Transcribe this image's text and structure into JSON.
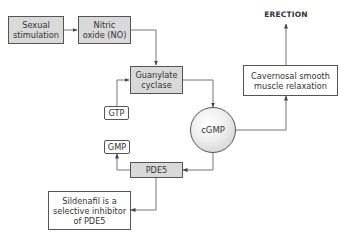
{
  "diagram": {
    "nodes": {
      "sexual_stimulation": "Sexual stimulation",
      "nitric_oxide": "Nitric oxide (NO)",
      "guanylate_cyclase": "Guanylate cyclase",
      "gtp": "GTP",
      "cgmp": "cGMP",
      "gmp": "GMP",
      "pde5": "PDE5",
      "sildenafil": "Sildenafil is a selective inhibitor of PDE5",
      "cavernosal": "Cavernosal smooth muscle relaxation",
      "erection": "ERECTION"
    },
    "edges": [
      {
        "from": "Sexual stimulation",
        "to": "Nitric oxide (NO)"
      },
      {
        "from": "Nitric oxide (NO)",
        "to": "Guanylate cyclase"
      },
      {
        "from": "GTP",
        "to": "Guanylate cyclase"
      },
      {
        "from": "Guanylate cyclase",
        "to": "cGMP"
      },
      {
        "from": "cGMP",
        "to": "Cavernosal smooth muscle relaxation"
      },
      {
        "from": "Cavernosal smooth muscle relaxation",
        "to": "ERECTION"
      },
      {
        "from": "cGMP",
        "to": "PDE5"
      },
      {
        "from": "PDE5",
        "to": "GMP"
      },
      {
        "from": "PDE5",
        "to": "Sildenafil is a selective inhibitor of PDE5"
      }
    ],
    "colors": {
      "box_fill": "#d9d9d9",
      "border": "#555555",
      "line": "#666666"
    }
  }
}
